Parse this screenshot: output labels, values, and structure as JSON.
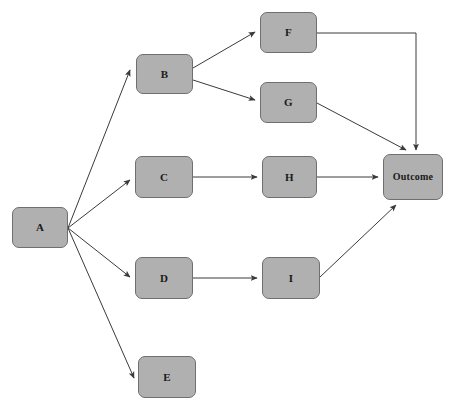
{
  "diagram": {
    "type": "directed-graph",
    "background_color": "#ffffff",
    "node_fill_color": "#b0b0b0",
    "node_border_color": "#6f6f6f",
    "edge_color": "#3a3a3a",
    "label_color": "#1a1a1a",
    "nodes": [
      {
        "id": "A",
        "label": "A",
        "x": 12,
        "y": 207,
        "w": 56,
        "h": 41,
        "font_size": 11
      },
      {
        "id": "B",
        "label": "B",
        "x": 136,
        "y": 54,
        "w": 57,
        "h": 40,
        "font_size": 11
      },
      {
        "id": "C",
        "label": "C",
        "x": 135,
        "y": 156,
        "w": 58,
        "h": 42,
        "font_size": 11
      },
      {
        "id": "D",
        "label": "D",
        "x": 135,
        "y": 257,
        "w": 58,
        "h": 42,
        "font_size": 11
      },
      {
        "id": "E",
        "label": "E",
        "x": 138,
        "y": 356,
        "w": 58,
        "h": 42,
        "font_size": 11
      },
      {
        "id": "F",
        "label": "F",
        "x": 260,
        "y": 12,
        "w": 57,
        "h": 41,
        "font_size": 11
      },
      {
        "id": "G",
        "label": "G",
        "x": 260,
        "y": 82,
        "w": 57,
        "h": 41,
        "font_size": 11
      },
      {
        "id": "H",
        "label": "H",
        "x": 262,
        "y": 156,
        "w": 55,
        "h": 42,
        "font_size": 11
      },
      {
        "id": "I",
        "label": "I",
        "x": 262,
        "y": 257,
        "w": 58,
        "h": 42,
        "font_size": 11
      },
      {
        "id": "Outcome",
        "label": "Outcome",
        "x": 383,
        "y": 154,
        "w": 60,
        "h": 46,
        "font_size": 10
      }
    ],
    "edges": [
      {
        "from": "A",
        "to": "B",
        "path": "M 68,228 L 130,70",
        "kind": "straight"
      },
      {
        "from": "A",
        "to": "C",
        "path": "M 68,228 L 130,180",
        "kind": "straight"
      },
      {
        "from": "A",
        "to": "D",
        "path": "M 68,228 L 130,277",
        "kind": "straight"
      },
      {
        "from": "A",
        "to": "E",
        "path": "M 68,228 L 134,378",
        "kind": "straight"
      },
      {
        "from": "B",
        "to": "F",
        "path": "M 193,68 L 255,32",
        "kind": "straight"
      },
      {
        "from": "B",
        "to": "G",
        "path": "M 193,80 L 255,100",
        "kind": "straight"
      },
      {
        "from": "C",
        "to": "H",
        "path": "M 193,177 L 257,177",
        "kind": "straight"
      },
      {
        "from": "D",
        "to": "I",
        "path": "M 193,278 L 257,278",
        "kind": "straight"
      },
      {
        "from": "F",
        "to": "Outcome",
        "path": "M 317,33 L 416,33 L 416,150",
        "kind": "elbow"
      },
      {
        "from": "G",
        "to": "Outcome",
        "path": "M 317,103 L 406,150",
        "kind": "straight"
      },
      {
        "from": "H",
        "to": "Outcome",
        "path": "M 317,177 L 378,177",
        "kind": "straight"
      },
      {
        "from": "I",
        "to": "Outcome",
        "path": "M 320,277 L 396,205",
        "kind": "straight"
      }
    ]
  }
}
